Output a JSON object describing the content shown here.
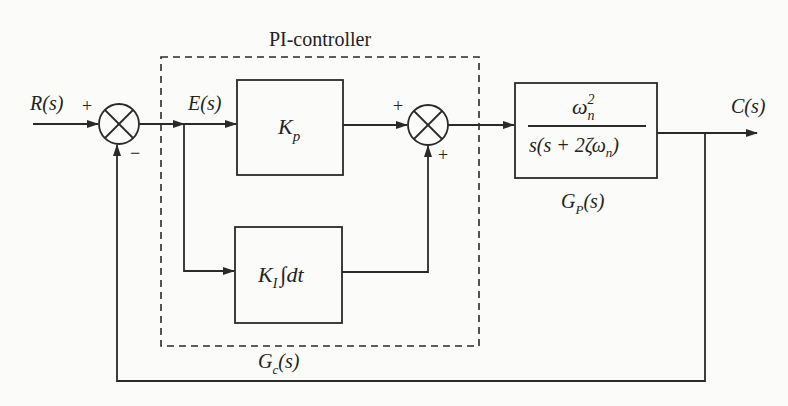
{
  "diagram": {
    "type": "block-diagram",
    "controller_label": "PI-controller",
    "signals": {
      "input": "R(s)",
      "error": "E(s)",
      "output": "C(s)"
    },
    "junction1": {
      "plus": "+",
      "minus": "−"
    },
    "junction2": {
      "plus_top": "+",
      "plus_bottom": "+"
    },
    "blocks": {
      "kp": {
        "label_main": "K",
        "label_sub": "p"
      },
      "ki": {
        "label_main": "K",
        "label_sub": "I",
        "label_rest": "∫dt"
      },
      "plant": {
        "numerator_main": "ω",
        "numerator_sup": "2",
        "numerator_sub": "n",
        "denominator": "s(s + 2ζω",
        "denominator_sub": "n",
        "denominator_close": ")"
      }
    },
    "captions": {
      "controller_tf_main": "G",
      "controller_tf_sub": "c",
      "controller_tf_rest": "(s)",
      "plant_tf_main": "G",
      "plant_tf_sub": "P",
      "plant_tf_rest": "(s)"
    }
  }
}
